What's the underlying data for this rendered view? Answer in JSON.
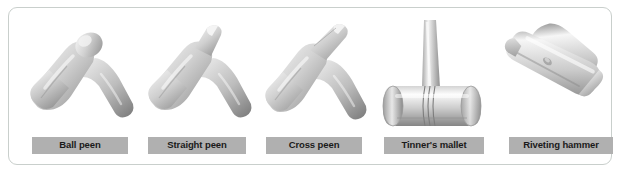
{
  "figure": {
    "panel_border_color": "#c9cfcc",
    "background_color": "#ffffff",
    "label_background_color": "#b0b0b0",
    "label_text_color": "#1a1a1a",
    "metal_light": "#f2f2f2",
    "metal_mid": "#c2c2c2",
    "metal_dark": "#8e8e8e",
    "tools": [
      {
        "label": "Ball peen",
        "icon": "ball-peen-hammer-icon"
      },
      {
        "label": "Straight peen",
        "icon": "straight-peen-hammer-icon"
      },
      {
        "label": "Cross peen",
        "icon": "cross-peen-hammer-icon"
      },
      {
        "label": "Tinner's mallet",
        "icon": "tinners-mallet-icon"
      },
      {
        "label": "Riveting hammer",
        "icon": "riveting-hammer-icon"
      }
    ]
  }
}
